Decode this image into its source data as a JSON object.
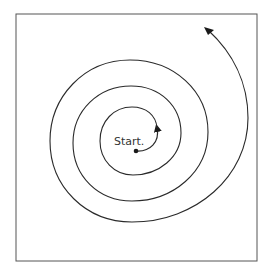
{
  "diagram": {
    "type": "spiral",
    "start_label": "Start.",
    "stroke_color": "#2a2a2a",
    "frame_color": "#555555",
    "background": "#ffffff",
    "direction": "outward, counter-clockwise arrows",
    "turns": 4
  }
}
